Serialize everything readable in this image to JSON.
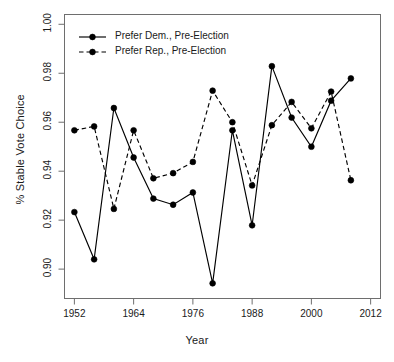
{
  "chart_data": {
    "type": "line",
    "title": "",
    "xlabel": "Year",
    "ylabel": "% Stable Vote Choice",
    "xlim": [
      1950,
      2014
    ],
    "ylim": [
      0.888,
      1.004
    ],
    "xticks": [
      "1952",
      "1964",
      "1976",
      "1988",
      "2000",
      "2012"
    ],
    "xtick_values": [
      1952,
      1964,
      1976,
      1988,
      2000,
      2012
    ],
    "yticks": [
      "0.90",
      "0.92",
      "0.94",
      "0.96",
      "0.98",
      "1.00"
    ],
    "ytick_values": [
      0.9,
      0.92,
      0.94,
      0.96,
      0.98,
      1.0
    ],
    "grid": false,
    "legend_position": "top-left",
    "marker": "filled-circle",
    "x": [
      1952,
      1956,
      1960,
      1964,
      1968,
      1972,
      1976,
      1980,
      1984,
      1988,
      1992,
      1996,
      2000,
      2004,
      2008
    ],
    "series": [
      {
        "name": "Prefer Dem., Pre-Election",
        "linestyle": "solid",
        "color": "#000000",
        "values": [
          0.9233,
          0.904,
          0.9658,
          0.9456,
          0.9288,
          0.9263,
          0.9313,
          0.8942,
          0.9567,
          0.9179,
          0.9829,
          0.9619,
          0.95,
          0.9688,
          0.9779
        ]
      },
      {
        "name": "Prefer Rep., Pre-Election",
        "linestyle": "dashed",
        "color": "#000000",
        "values": [
          0.9567,
          0.9583,
          0.9246,
          0.9567,
          0.9371,
          0.9392,
          0.9438,
          0.9729,
          0.96,
          0.9342,
          0.9588,
          0.9683,
          0.9575,
          0.9725,
          0.9363
        ]
      }
    ]
  },
  "legend": {
    "items": [
      {
        "label": "Prefer Dem., Pre-Election",
        "style": "solid"
      },
      {
        "label": "Prefer Rep., Pre-Election",
        "style": "dashed"
      }
    ]
  },
  "axis": {
    "x_title": "Year",
    "y_title": "% Stable Vote Choice"
  }
}
